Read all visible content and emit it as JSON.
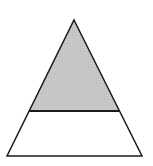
{
  "diagram": {
    "type": "partitioned-triangle",
    "canvas": {
      "width": 153,
      "height": 166,
      "background": "#ffffff"
    },
    "triangle": {
      "apex": [
        74,
        20
      ],
      "bottom_left": [
        7,
        156
      ],
      "bottom_right": [
        142,
        156
      ],
      "stroke": "#1a1a1a",
      "stroke_width": 1.5
    },
    "divider": {
      "y": 111,
      "x1": 29.2,
      "x2": 119.8
    },
    "regions": [
      {
        "name": "top",
        "fill": "#c6c6c6",
        "shaded": true
      },
      {
        "name": "bottom",
        "fill": "#ffffff",
        "shaded": false
      }
    ],
    "labels": []
  }
}
